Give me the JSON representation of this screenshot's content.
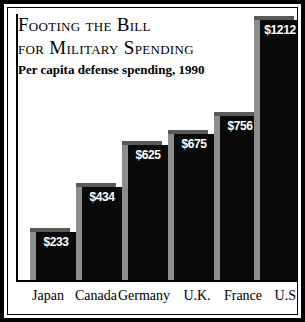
{
  "chart_data": {
    "type": "bar",
    "title": "Footing the Bill for Military Spending",
    "title_lines": [
      "Footing the Bill",
      "for Military Spending"
    ],
    "subtitle": "Per capita defense spending, 1990",
    "xlabel": "",
    "ylabel": "",
    "ylim": [
      0,
      1212
    ],
    "grid": false,
    "legend": "none",
    "categories": [
      "Japan",
      "Canada",
      "Germany",
      "U.K.",
      "France",
      "U.S."
    ],
    "values": [
      233,
      434,
      625,
      675,
      756,
      1212
    ],
    "value_labels": [
      "$233",
      "$434",
      "$625",
      "$675",
      "$756",
      "$1212"
    ],
    "bars": [
      {
        "category": "Japan",
        "value": 233,
        "label": "$233",
        "left": 16,
        "height": 52
      },
      {
        "category": "Canada",
        "value": 434,
        "label": "$434",
        "left": 62,
        "height": 97
      },
      {
        "category": "Germany",
        "value": 625,
        "label": "$625",
        "left": 108,
        "height": 139
      },
      {
        "category": "U.K.",
        "value": 675,
        "label": "$675",
        "left": 154,
        "height": 150
      },
      {
        "category": "France",
        "value": 756,
        "label": "$756",
        "left": 200,
        "height": 168
      },
      {
        "category": "U.S.",
        "value": 1212,
        "label": "$1212",
        "left": 240,
        "height": 264
      }
    ],
    "category_positions": [
      5,
      53,
      101,
      154,
      200,
      244
    ],
    "colors": {
      "bar_front": "#0a0a0a",
      "bar_side": "#8d8d8d",
      "bar_top": "#5a5a5a",
      "frame": "#000000",
      "background": "#ffffff",
      "value_text": "#ffffff",
      "axis": "#000000"
    }
  }
}
